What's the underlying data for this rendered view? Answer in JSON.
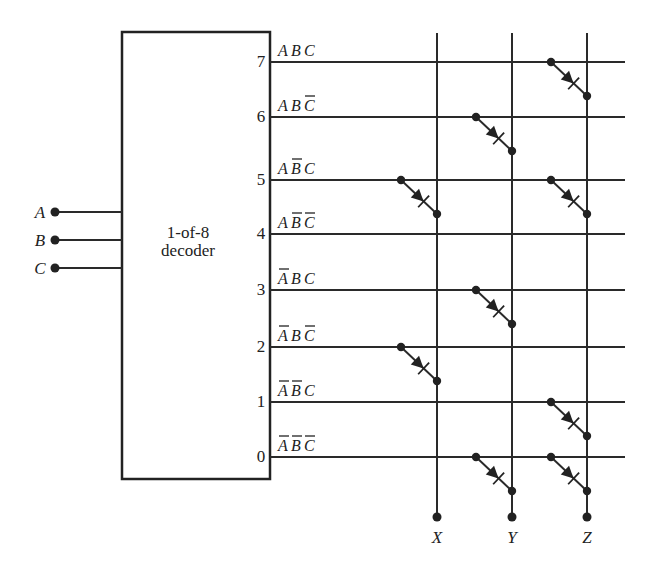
{
  "decoder": {
    "label_line1": "1-of-8",
    "label_line2": "decoder"
  },
  "inputs": [
    {
      "name": "A",
      "y": 212
    },
    {
      "name": "B",
      "y": 240
    },
    {
      "name": "C",
      "y": 268
    }
  ],
  "rows": [
    {
      "index": "7",
      "y": 62,
      "terms": [
        {
          "v": "A",
          "bar": false
        },
        {
          "v": "B",
          "bar": false
        },
        {
          "v": "C",
          "bar": false
        }
      ]
    },
    {
      "index": "6",
      "y": 117,
      "terms": [
        {
          "v": "A",
          "bar": false
        },
        {
          "v": "B",
          "bar": false
        },
        {
          "v": "C",
          "bar": true
        }
      ]
    },
    {
      "index": "5",
      "y": 180,
      "terms": [
        {
          "v": "A",
          "bar": false
        },
        {
          "v": "B",
          "bar": true
        },
        {
          "v": "C",
          "bar": false
        }
      ]
    },
    {
      "index": "4",
      "y": 234,
      "terms": [
        {
          "v": "A",
          "bar": false
        },
        {
          "v": "B",
          "bar": true
        },
        {
          "v": "C",
          "bar": true
        }
      ]
    },
    {
      "index": "3",
      "y": 290,
      "terms": [
        {
          "v": "A",
          "bar": true
        },
        {
          "v": "B",
          "bar": false
        },
        {
          "v": "C",
          "bar": false
        }
      ]
    },
    {
      "index": "2",
      "y": 347,
      "terms": [
        {
          "v": "A",
          "bar": true
        },
        {
          "v": "B",
          "bar": false
        },
        {
          "v": "C",
          "bar": true
        }
      ]
    },
    {
      "index": "1",
      "y": 402,
      "terms": [
        {
          "v": "A",
          "bar": true
        },
        {
          "v": "B",
          "bar": true
        },
        {
          "v": "C",
          "bar": false
        }
      ]
    },
    {
      "index": "0",
      "y": 457,
      "terms": [
        {
          "v": "A",
          "bar": true
        },
        {
          "v": "B",
          "bar": true
        },
        {
          "v": "C",
          "bar": true
        }
      ]
    }
  ],
  "outputs": [
    {
      "name": "X",
      "x": 437
    },
    {
      "name": "Y",
      "x": 512
    },
    {
      "name": "Z",
      "x": 587
    }
  ],
  "diodes": [
    {
      "row": "7",
      "output": "Z"
    },
    {
      "row": "6",
      "output": "Y"
    },
    {
      "row": "5",
      "output": "X"
    },
    {
      "row": "5",
      "output": "Z"
    },
    {
      "row": "3",
      "output": "Y"
    },
    {
      "row": "2",
      "output": "X"
    },
    {
      "row": "1",
      "output": "Z"
    },
    {
      "row": "0",
      "output": "Y"
    },
    {
      "row": "0",
      "output": "Z"
    }
  ]
}
